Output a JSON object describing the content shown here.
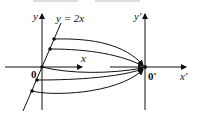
{
  "diagram": {
    "caption_partial": "",
    "left_frame": {
      "x_label": "x",
      "y_label": "y",
      "origin_label": "0",
      "line_label": "y = 2x"
    },
    "right_frame": {
      "x_label": "x'",
      "y_label": "y'",
      "origin_label": "0'"
    },
    "points_on_line_count": 5,
    "mapping_description": "each point on the line y = 2x maps to the origin 0'"
  }
}
